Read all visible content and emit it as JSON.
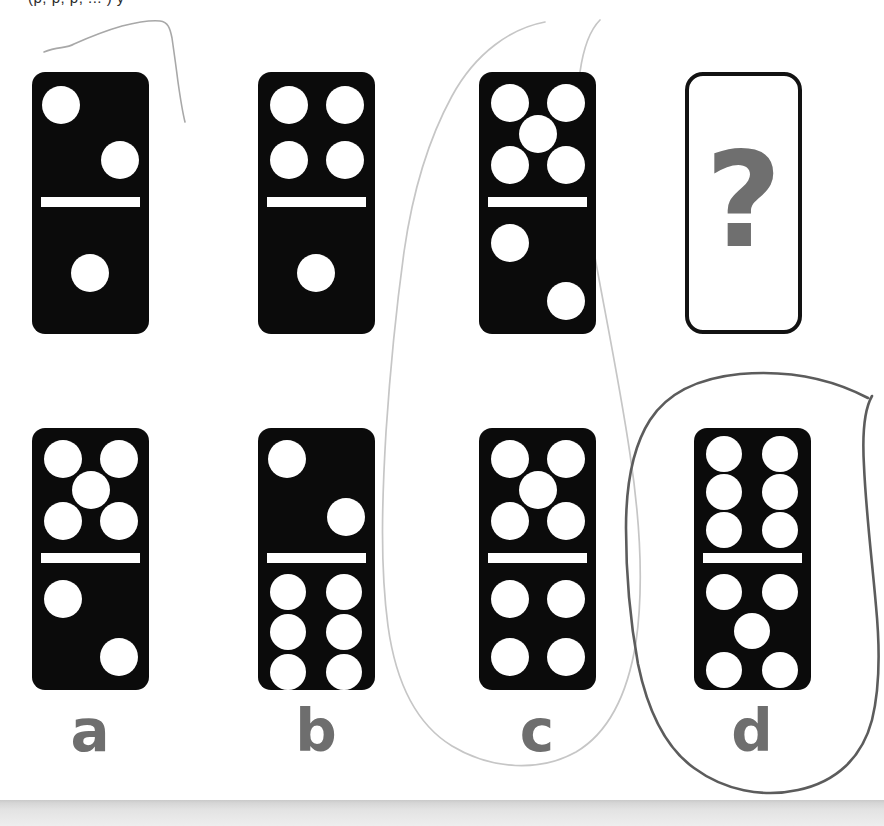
{
  "page": {
    "top_cropped_text": "(p, p, p, ... ) y",
    "background_color": "#ffffff",
    "tile_color": "#0b0b0b",
    "pip_color": "#ffffff",
    "label_color": "#6e6e6e",
    "question_mark_color": "#6f6f6f",
    "annotation_color_dark": "#5a5a5a",
    "annotation_color_light": "#bdbdbd"
  },
  "puzzle": {
    "type": "domino-sequence",
    "question_symbol": "?",
    "sequence": [
      {
        "name": "sequence-domino-1",
        "top_pips": 2,
        "bottom_pips": 1,
        "top_layout": "diagonal-2-tl-mr",
        "bottom_layout": "center-1",
        "x": 32,
        "y": 72,
        "w": 117,
        "h": 262
      },
      {
        "name": "sequence-domino-2",
        "top_pips": 4,
        "bottom_pips": 1,
        "top_layout": "grid-2x2",
        "bottom_layout": "center-1",
        "x": 258,
        "y": 72,
        "w": 117,
        "h": 262
      },
      {
        "name": "sequence-domino-3",
        "top_pips": 5,
        "bottom_pips": 2,
        "top_layout": "quincunx-5",
        "bottom_layout": "diagonal-2-tl-br",
        "x": 479,
        "y": 72,
        "w": 117,
        "h": 262
      }
    ],
    "question_tile": {
      "name": "question-tile",
      "x": 685,
      "y": 72,
      "w": 117,
      "h": 262
    },
    "options": [
      {
        "name": "option-a",
        "label": "a",
        "top_pips": 5,
        "bottom_pips": 2,
        "top_layout": "quincunx-5",
        "bottom_layout": "diagonal-2-tl-br",
        "x": 32,
        "y": 428,
        "w": 117,
        "h": 262,
        "circled": false
      },
      {
        "name": "option-b",
        "label": "b",
        "top_pips": 2,
        "bottom_pips": 6,
        "top_layout": "diagonal-2-tl-mr",
        "bottom_layout": "grid-2x3",
        "x": 258,
        "y": 428,
        "w": 117,
        "h": 262,
        "circled": false
      },
      {
        "name": "option-c",
        "label": "c",
        "top_pips": 5,
        "bottom_pips": 4,
        "top_layout": "quincunx-5",
        "bottom_layout": "grid-2x2",
        "x": 479,
        "y": 428,
        "w": 117,
        "h": 262,
        "circled": true,
        "circle_style": "light"
      },
      {
        "name": "option-d",
        "label": "d",
        "top_pips": 6,
        "bottom_pips": 5,
        "top_layout": "grid-2x3",
        "bottom_layout": "quincunx-5",
        "x": 694,
        "y": 428,
        "w": 117,
        "h": 262,
        "circled": true,
        "circle_style": "dark"
      }
    ]
  },
  "annotations": {
    "stray_line_top_left": "faint pencil arc above first domino",
    "ellipse_option_c": "faint pencil ellipse around option c",
    "ellipse_option_d": "dark pencil ellipse around option d"
  }
}
